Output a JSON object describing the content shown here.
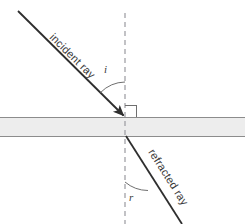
{
  "diagram": {
    "background_color": "#ffffff",
    "ray_color": "#2e2e2e",
    "slab_fill_color": "#ededed",
    "slab_edge_color": "#8c8c8c",
    "normal_color": "#9a9aa0",
    "labels": {
      "incident_ray": "incident ray",
      "refracted_ray": "refracted ray",
      "angle_of_incidence": "i",
      "angle_of_refraction": "r"
    },
    "geometry": {
      "incident_ray_start": [
        18,
        11
      ],
      "incidence_point": [
        125,
        117
      ],
      "exit_point": [
        127,
        137
      ],
      "refracted_ray_end": [
        182,
        224
      ],
      "normal_x": 125,
      "normal_top_y": 13,
      "normal_bottom_y": 224,
      "slab_top_y": 117,
      "slab_bottom_y": 137,
      "slab_left_x": 0,
      "slab_right_x": 245
    }
  }
}
